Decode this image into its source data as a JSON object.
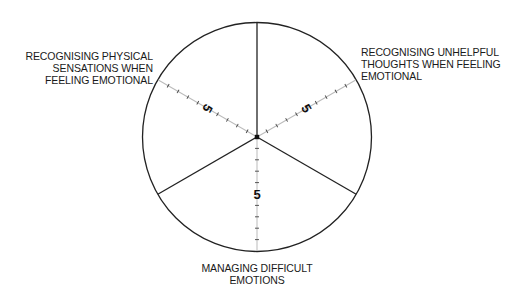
{
  "wheel": {
    "center": [
      257,
      137
    ],
    "radius": 115,
    "segments": [
      {
        "name": "recognising-physical-sensations",
        "label_lines": [
          "RECOGNISING PHYSICAL",
          "SENSATIONS WHEN",
          "FEELING EMOTIONAL"
        ],
        "scale_midpoint_label": "5"
      },
      {
        "name": "recognising-unhelpful-thoughts",
        "label_lines": [
          "RECOGNISING UNHELPFUL",
          "THOUGHTS WHEN FEELING",
          "EMOTIONAL"
        ],
        "scale_midpoint_label": "5"
      },
      {
        "name": "managing-difficult-emotions",
        "label_lines": [
          "MANAGING DIFFICULT",
          "EMOTIONS"
        ],
        "scale_midpoint_label": "5"
      }
    ],
    "scale": {
      "min": 0,
      "max": 10,
      "ticks": 10
    },
    "colors": {
      "outline": "#222222",
      "scale_line": "#bbbbbb",
      "tick": "#444444"
    }
  }
}
